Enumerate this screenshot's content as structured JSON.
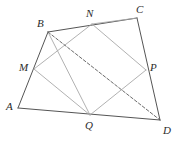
{
  "figure": {
    "type": "geometry-diagram",
    "width": 178,
    "height": 143,
    "background_color": "#ffffff"
  },
  "styles": {
    "outer_edge_color": "#555555",
    "inner_edge_color": "#a8a8a8",
    "dashed_edge_color": "#5a5a5a",
    "label_color": "#2b2b2b",
    "outer_edge_width": 1.0,
    "inner_edge_width": 0.9,
    "dashed_edge_width": 0.9,
    "dash_pattern": "3,2"
  },
  "points": [
    {
      "id": "A",
      "label": "A",
      "x": 18,
      "y": 108,
      "label_x": 6,
      "label_y": 101
    },
    {
      "id": "B",
      "label": "B",
      "x": 48,
      "y": 32,
      "label_x": 37,
      "label_y": 18
    },
    {
      "id": "C",
      "label": "C",
      "x": 137,
      "y": 18,
      "label_x": 136,
      "label_y": 4
    },
    {
      "id": "D",
      "label": "D",
      "x": 160,
      "y": 120,
      "label_x": 163,
      "label_y": 125
    },
    {
      "id": "M",
      "label": "M",
      "x": 34,
      "y": 69,
      "label_x": 19,
      "label_y": 62
    },
    {
      "id": "N",
      "label": "N",
      "x": 92,
      "y": 24,
      "label_x": 86,
      "label_y": 8
    },
    {
      "id": "P",
      "label": "P",
      "x": 146,
      "y": 70,
      "label_x": 150,
      "label_y": 62
    },
    {
      "id": "Q",
      "label": "Q",
      "x": 90,
      "y": 115,
      "label_x": 85,
      "label_y": 120
    }
  ],
  "segments": [
    {
      "id": "AB",
      "from": "A",
      "to": "B",
      "style": "outer"
    },
    {
      "id": "BC",
      "from": "B",
      "to": "C",
      "style": "outer"
    },
    {
      "id": "CD",
      "from": "C",
      "to": "D",
      "style": "outer"
    },
    {
      "id": "AD",
      "from": "A",
      "to": "D",
      "style": "outer"
    },
    {
      "id": "MN",
      "from": "M",
      "to": "N",
      "style": "inner"
    },
    {
      "id": "NP",
      "from": "N",
      "to": "P",
      "style": "inner"
    },
    {
      "id": "PQ",
      "from": "P",
      "to": "Q",
      "style": "inner"
    },
    {
      "id": "QM",
      "from": "Q",
      "to": "M",
      "style": "inner"
    },
    {
      "id": "BQ",
      "from": "B",
      "to": "Q",
      "style": "inner"
    },
    {
      "id": "NC",
      "from": "N",
      "to": "C",
      "style": "inner"
    },
    {
      "id": "BD",
      "from": "B",
      "to": "D",
      "style": "dashed"
    }
  ]
}
